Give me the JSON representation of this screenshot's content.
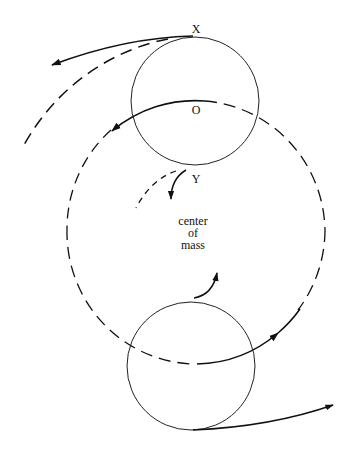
{
  "diagram": {
    "labels": {
      "x": "X",
      "o": "O",
      "y": "Y",
      "com_line1": "center",
      "com_line2": "of",
      "com_line3": "mass"
    },
    "colors": {
      "stroke": "#111111",
      "background": "#ffffff"
    },
    "elements": [
      {
        "name": "top-body-circle",
        "style": "solid"
      },
      {
        "name": "bottom-body-circle",
        "style": "solid"
      },
      {
        "name": "orbit-path",
        "style": "dashed, partially solid with arrows"
      },
      {
        "name": "trajectory-from-X",
        "style": "solid arrow tangent + dashed curve"
      },
      {
        "name": "trajectory-from-Y",
        "style": "solid arrow + dashed curve"
      },
      {
        "name": "trajectory-from-bottom",
        "style": "solid arrow"
      }
    ]
  }
}
